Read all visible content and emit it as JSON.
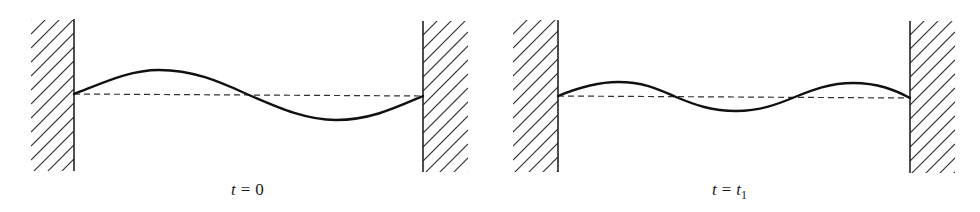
{
  "figure": {
    "colors": {
      "string": "#111111",
      "equilibrium": "#333333",
      "wall": "#222222",
      "hatch": "#333333"
    },
    "panels": [
      {
        "id": "t0",
        "label": {
          "var": "t",
          "eq": "=",
          "rhs": "0",
          "rhs_sub": ""
        },
        "mode": "one full wavelength: crest then trough (second harmonic shape)",
        "string_shape": "sine-like, one crest and one trough"
      },
      {
        "id": "t1",
        "label": {
          "var": "t",
          "eq": "=",
          "rhs": "t",
          "rhs_sub": "1"
        },
        "mode": "three half-wavelengths: crest, trough, crest (third harmonic shape)",
        "string_shape": "sine-like, two crests and one trough"
      }
    ]
  }
}
